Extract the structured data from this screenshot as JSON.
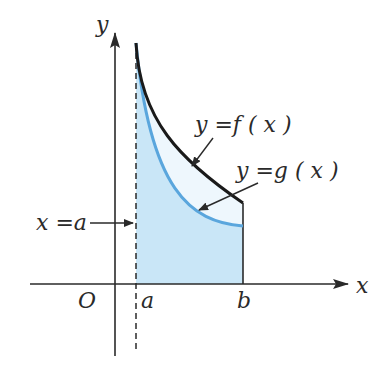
{
  "diagram": {
    "axes": {
      "x_label": "x",
      "y_label": "y",
      "origin_label": "O"
    },
    "bounds": {
      "a_label": "a",
      "b_label": "b",
      "line_label": "x =a"
    },
    "curves": [
      {
        "name": "f",
        "label": "y =f ( x )",
        "color": "#1a1a1a"
      },
      {
        "name": "g",
        "label": "y =g ( x )",
        "color": "#5aa6dd"
      }
    ],
    "colors": {
      "region_under_g": "#c9e6f7",
      "region_between": "#eef7fd",
      "axis": "#2a2a2a"
    }
  }
}
